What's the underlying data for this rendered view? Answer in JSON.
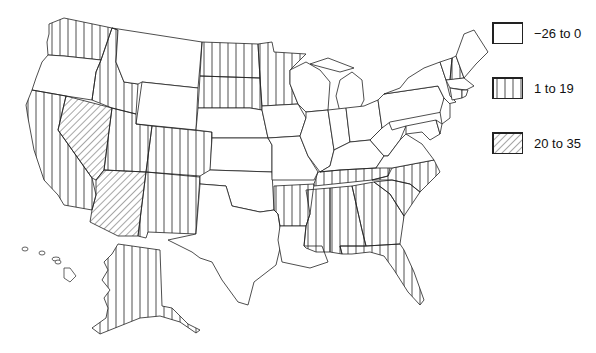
{
  "legend": {
    "items": [
      {
        "label": "−26 to 0",
        "pattern": "blank"
      },
      {
        "label": "1 to 19",
        "pattern": "vertical"
      },
      {
        "label": "20 to 35",
        "pattern": "diagonal"
      }
    ]
  },
  "map": {
    "region": "United States",
    "categories": {
      "blank": [
        "OR",
        "MT",
        "WY",
        "NE",
        "KS",
        "OK",
        "TX",
        "IA",
        "MO",
        "WI",
        "MI",
        "IL",
        "IN",
        "OH",
        "KY",
        "WV",
        "VA",
        "PA",
        "NY",
        "VT",
        "ME",
        "MA",
        "CT",
        "RI",
        "NJ",
        "DE",
        "MD",
        "LA",
        "HI"
      ],
      "vertical": [
        "WA",
        "CA",
        "ID",
        "UT",
        "CO",
        "NM",
        "ND",
        "SD",
        "MN",
        "AR",
        "TN",
        "MS",
        "AL",
        "GA",
        "SC",
        "NC",
        "FL",
        "NH",
        "AK"
      ],
      "diagonal": [
        "NV",
        "AZ"
      ]
    }
  }
}
